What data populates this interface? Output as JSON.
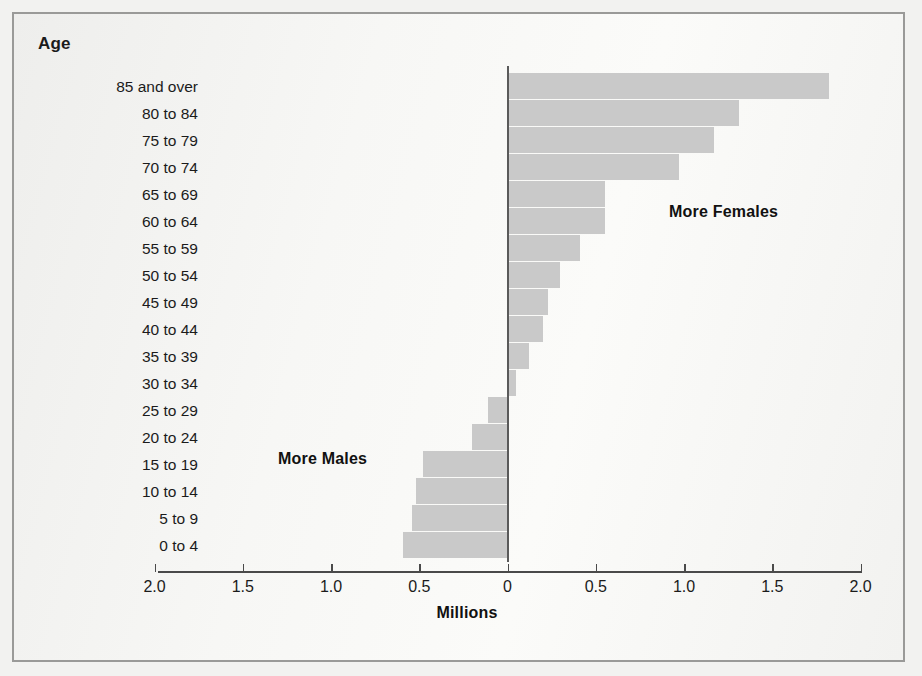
{
  "axis": {
    "y_title": "Age",
    "x_title": "Millions",
    "tick_labels": [
      "2.0",
      "1.5",
      "1.0",
      "0.5",
      "0",
      "0.5",
      "1.0",
      "1.5",
      "2.0"
    ],
    "tick_values": [
      -2.0,
      -1.5,
      -1.0,
      -0.5,
      0,
      0.5,
      1.0,
      1.5,
      2.0
    ]
  },
  "annotations": {
    "males": "More Males",
    "females": "More Females"
  },
  "colors": {
    "bar": "#c9c9c9",
    "axis": "#4a4a4a",
    "zero_line": "#5a5a5a",
    "frame": "#9a9a98",
    "background": "#f5f5f3",
    "text": "#1b1b1b"
  },
  "chart_data": {
    "type": "bar",
    "orientation": "horizontal",
    "title": "",
    "subtitle": "",
    "xlabel": "Millions",
    "ylabel": "Age",
    "xlim": [
      -2.0,
      2.0
    ],
    "grid": false,
    "legend": null,
    "note": "Diverging population pyramid of the excess of one sex over the other by age group. Negative values (left of zero) indicate more males; positive values (right of zero) indicate more females.",
    "categories": [
      "85 and over",
      "80 to 84",
      "75 to 79",
      "70 to 74",
      "65 to 69",
      "60 to 64",
      "55 to 59",
      "50 to 54",
      "45 to 49",
      "40 to 44",
      "35 to 39",
      "30 to 34",
      "25 to 29",
      "20 to 24",
      "15 to 19",
      "10 to 14",
      "5 to 9",
      "0 to 4"
    ],
    "values": [
      1.82,
      1.31,
      1.17,
      0.97,
      0.55,
      0.55,
      0.41,
      0.3,
      0.23,
      0.2,
      0.12,
      0.05,
      -0.11,
      -0.2,
      -0.48,
      -0.52,
      -0.54,
      -0.59
    ],
    "value_labels": [
      "1.82",
      "1.31",
      "1.17",
      "0.97",
      "0.55",
      "0.55",
      "0.41",
      "0.30",
      "0.23",
      "0.20",
      "0.12",
      "0.05",
      "-0.11",
      "-0.20",
      "-0.48",
      "-0.52",
      "-0.54",
      "-0.59"
    ]
  }
}
